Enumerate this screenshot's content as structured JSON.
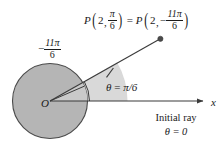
{
  "figure": {
    "colors": {
      "circle_fill": "#b5b5b5",
      "circle_stroke": "#4a4a4a",
      "sector_fill": "#d9d9d9",
      "line": "#3a3a3a",
      "text": "#1a1a1a",
      "background": "#ffffff"
    },
    "geometry": {
      "origin_x": 50,
      "origin_y": 101,
      "circle_radius": 37.5,
      "ray_angle_deg": 30,
      "ray_tip_x": 160,
      "ray_tip_y": 39,
      "x_axis_end_x": 207,
      "tick_position_x": 110,
      "tick_position_y": 72
    }
  },
  "point_label": {
    "p1": {
      "symbol": "P",
      "open_paren": "(",
      "radius": "2",
      "comma": ",",
      "angle_numerator": "π",
      "angle_denominator": "6",
      "close_paren": ")"
    },
    "equals": "=",
    "p2": {
      "symbol": "P",
      "open_paren": "(",
      "radius": "2",
      "comma": ",",
      "minus": "−",
      "angle_numerator": "11π",
      "angle_denominator": "6",
      "close_paren": ")"
    }
  },
  "negative_angle_label": {
    "minus": "−",
    "numerator": "11π",
    "denominator": "6"
  },
  "theta_label": {
    "text": "θ = π/6",
    "theta": "θ",
    "equals": "=",
    "value": "π/6"
  },
  "axis": {
    "x_label": "x"
  },
  "origin": {
    "label": "O"
  },
  "initial_ray": {
    "line1": "Initial ray",
    "line2": "θ = 0"
  }
}
